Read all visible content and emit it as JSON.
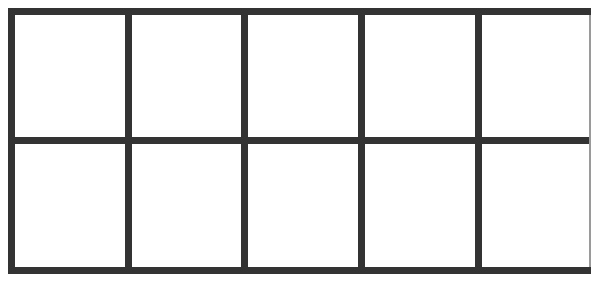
{
  "diagram": {
    "type": "empty-grid",
    "rows": 2,
    "columns": 5,
    "line_color": "#333333",
    "background": "#ffffff",
    "cells": [
      [
        "",
        "",
        "",
        "",
        ""
      ],
      [
        "",
        "",
        "",
        "",
        ""
      ]
    ]
  }
}
